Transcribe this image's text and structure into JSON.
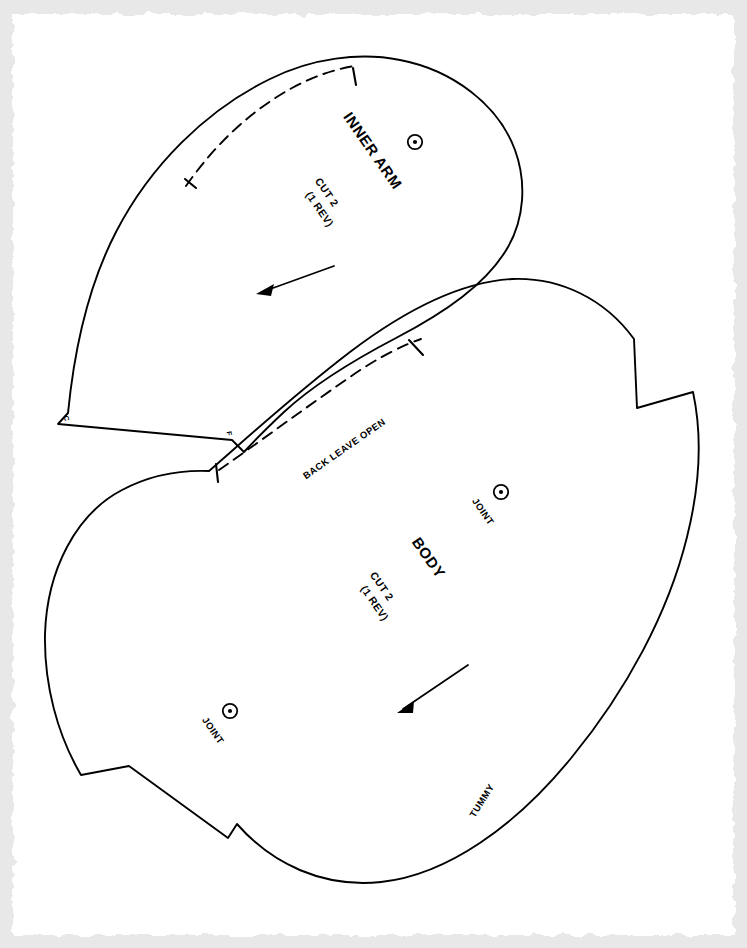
{
  "document": {
    "type": "sewing-pattern-sheet",
    "background_color": "#e8e8e8",
    "paper_color": "#ffffff",
    "ink_color": "#000000",
    "paper_edge": "torn-deckled"
  },
  "pieces": [
    {
      "id": "inner-arm",
      "name": "INNER ARM",
      "cut_line1": "CUT 2",
      "cut_line2": "(1 REV)",
      "markers": [
        {
          "id": "joint-arm",
          "type": "joint-circle",
          "label": ""
        }
      ],
      "corner_letters": [
        {
          "id": "corner-c",
          "text": "C"
        },
        {
          "id": "corner-f",
          "text": "F"
        }
      ],
      "grainline": "arrow",
      "stitch_line": "dashed"
    },
    {
      "id": "body",
      "name": "BODY",
      "cut_line1": "CUT 2",
      "cut_line2": "(1 REV)",
      "markers": [
        {
          "id": "joint-upper",
          "type": "joint-circle",
          "label": "JOINT"
        },
        {
          "id": "joint-lower",
          "type": "joint-circle",
          "label": "JOINT"
        }
      ],
      "edge_labels": [
        {
          "id": "back-leave-open",
          "text": "BACK LEAVE OPEN"
        },
        {
          "id": "tummy",
          "text": "TUMMY"
        }
      ],
      "grainline": "arrow",
      "stitch_line": "dashed"
    }
  ],
  "labels": {
    "inner_arm_name": "INNER ARM",
    "inner_arm_cut": "CUT 2",
    "inner_arm_rev": "(1 REV)",
    "corner_c": "C",
    "corner_f": "F",
    "back_leave_open": "BACK LEAVE OPEN",
    "body_name": "BODY",
    "body_cut": "CUT 2",
    "body_rev": "(1 REV)",
    "joint_upper": "JOINT",
    "joint_lower": "JOINT",
    "tummy": "TUMMY"
  }
}
